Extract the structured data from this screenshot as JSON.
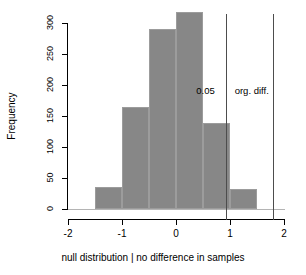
{
  "chart_data": {
    "type": "bar",
    "title": "",
    "subtitle": "",
    "xlabel": "null distribution | no difference in samples",
    "ylabel": "Frequency",
    "bin_width": 0.5,
    "bin_edges": [
      -1.5,
      -1.0,
      -0.5,
      0.0,
      0.5,
      1.0,
      1.5
    ],
    "categories": [
      "-1.5 to -1.0",
      "-1.0 to -0.5",
      "-0.5 to 0.0",
      "0.0 to 0.5",
      "0.5 to 1.0",
      "1.0 to 1.5"
    ],
    "bin_centers": [
      -1.25,
      -0.75,
      -0.25,
      0.25,
      0.75,
      1.25
    ],
    "values": [
      35,
      164,
      290,
      318,
      139,
      33
    ],
    "xlim": [
      -2,
      2
    ],
    "ylim": [
      0,
      330
    ],
    "xticks": [
      -2,
      -1,
      0,
      1,
      2
    ],
    "xtick_labels": [
      "-2",
      "-1",
      "0",
      "1",
      "2"
    ],
    "yticks": [
      0,
      50,
      100,
      150,
      200,
      250,
      300
    ],
    "ytick_labels": [
      "0",
      "50",
      "100",
      "150",
      "200",
      "250",
      "300"
    ],
    "grid": false,
    "legend": false,
    "bar_color": "#878787",
    "bar_edge_color": "#9c9c9c",
    "annotations": [
      {
        "name": "significance-threshold",
        "label": "0.05",
        "x": 0.93,
        "orientation": "vertical",
        "color": "#4d4d4d"
      },
      {
        "name": "observed-difference",
        "label": "org. diff.",
        "x": 1.79,
        "orientation": "vertical",
        "color": "#4d4d4d"
      }
    ]
  },
  "axes": {
    "x": {
      "label": "null distribution | no difference in samples",
      "ticks": [
        {
          "value": "-2"
        },
        {
          "value": "-1"
        },
        {
          "value": "0"
        },
        {
          "value": "1"
        },
        {
          "value": "2"
        }
      ]
    },
    "y": {
      "label": "Frequency",
      "ticks": [
        {
          "value": "0"
        },
        {
          "value": "50"
        },
        {
          "value": "100"
        },
        {
          "value": "150"
        },
        {
          "value": "200"
        },
        {
          "value": "250"
        },
        {
          "value": "300"
        }
      ]
    }
  },
  "annotations": {
    "p_value_line_label": "0.05",
    "observed_diff_line_label": "org. diff."
  }
}
